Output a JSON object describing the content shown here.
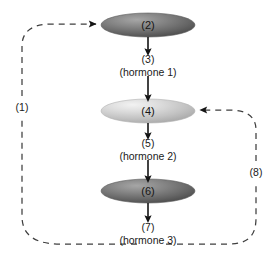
{
  "diagram": {
    "type": "endocrine-feedback-axis",
    "glands": [
      {
        "id": "gland-top",
        "label": "(2)",
        "shade": "dark",
        "fill_color": "#6a6a6a",
        "highlight_color": "#9a9a9a",
        "cx": 148,
        "cy": 25,
        "rx": 47,
        "ry": 12
      },
      {
        "id": "gland-middle",
        "label": "(4)",
        "shade": "light",
        "fill_color": "#b9b9b9",
        "highlight_color": "#e8e8e8",
        "cx": 148,
        "cy": 111,
        "rx": 47,
        "ry": 12
      },
      {
        "id": "gland-bottom",
        "label": "(6)",
        "shade": "dark",
        "fill_color": "#6a6a6a",
        "highlight_color": "#9a9a9a",
        "cx": 148,
        "cy": 191,
        "rx": 47,
        "ry": 12
      }
    ],
    "secretions": [
      {
        "id": "secretion-1",
        "number": "(3)",
        "name": "(hormone 1)",
        "x": 148,
        "y": 61
      },
      {
        "id": "secretion-2",
        "number": "(5)",
        "name": "(hormone 2)",
        "x": 148,
        "y": 145
      },
      {
        "id": "secretion-3",
        "number": "(7)",
        "name": "(hormone 3)",
        "x": 148,
        "y": 228
      }
    ],
    "feedback_loops": [
      {
        "id": "loop-left",
        "label": "(1)",
        "label_x": 22,
        "label_y": 107,
        "target": "gland-top"
      },
      {
        "id": "loop-right",
        "label": "(8)",
        "label_x": 256,
        "label_y": 172,
        "target": "gland-middle"
      }
    ],
    "colors": {
      "stroke": "#1a1a1a",
      "dashed_stroke": "#4d4d4d",
      "background": "#ffffff",
      "text": "#1a1a1a"
    }
  }
}
